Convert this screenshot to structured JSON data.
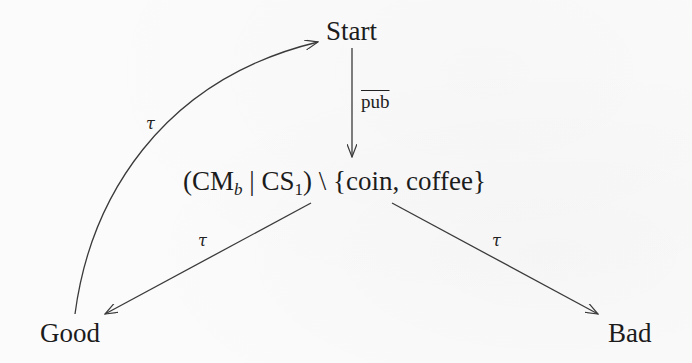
{
  "diagram": {
    "type": "labelled-transition-system",
    "nodes": {
      "start": {
        "label": "Start"
      },
      "center": {
        "open_paren": "(",
        "cm": "CM",
        "cm_sub": "b",
        "bar": " | ",
        "cs": "CS",
        "cs_sub": "1",
        "close_paren": ")",
        "restriction": " \\ ",
        "set": "{coin, coffee}"
      },
      "good": {
        "label": "Good"
      },
      "bad": {
        "label": "Bad"
      }
    },
    "edges": [
      {
        "from": "start",
        "to": "center",
        "label": "pub",
        "overline": true
      },
      {
        "from": "center",
        "to": "good",
        "label": "τ"
      },
      {
        "from": "center",
        "to": "bad",
        "label": "τ"
      },
      {
        "from": "good",
        "to": "start",
        "label": "τ",
        "curved": true
      }
    ],
    "labels": {
      "pub": "pub",
      "tau_left": "τ",
      "tau_right": "τ",
      "tau_curve": "τ"
    },
    "colors": {
      "stroke": "#3a3a3a",
      "text": "#1c1c1c",
      "background": "#fbfbfb"
    }
  }
}
